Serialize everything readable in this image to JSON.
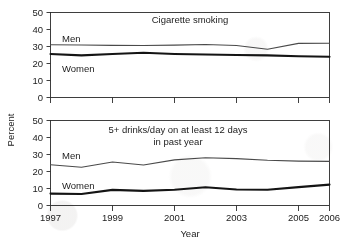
{
  "figure": {
    "xlabel": "Year",
    "ylabel": "Percent"
  },
  "panels": {
    "top": {
      "title": "Cigarette smoking",
      "men_label": "Men",
      "women_label": "Women",
      "yticks": [
        "0",
        "10",
        "20",
        "30",
        "40",
        "50"
      ]
    },
    "bottom": {
      "title_line1": "5+ drinks/day on at least 12 days",
      "title_line2": "in past year",
      "men_label": "Men",
      "women_label": "Women",
      "yticks": [
        "0",
        "10",
        "20",
        "30",
        "40",
        "50"
      ]
    }
  },
  "xticks": [
    "1997",
    "1999",
    "2001",
    "2003",
    "2005",
    "2006"
  ],
  "chart_data": [
    {
      "type": "line",
      "title": "Cigarette smoking",
      "xlabel": "Year",
      "ylabel": "Percent",
      "x": [
        1997,
        1998,
        1999,
        2000,
        2001,
        2002,
        2003,
        2004,
        2005,
        2006
      ],
      "xlim": [
        1997,
        2006
      ],
      "ylim": [
        0,
        50
      ],
      "yticks": [
        0,
        10,
        20,
        30,
        40,
        50
      ],
      "xticks": [
        1997,
        1999,
        2001,
        2003,
        2005,
        2006
      ],
      "grid": false,
      "legend": "inline-labels",
      "series": [
        {
          "name": "Men",
          "values": [
            31.0,
            30.9,
            30.7,
            30.6,
            30.8,
            31.2,
            30.6,
            28.4,
            31.8,
            31.9
          ],
          "style": "thin-gray"
        },
        {
          "name": "Women",
          "values": [
            25.6,
            24.8,
            25.6,
            26.3,
            25.6,
            25.3,
            25.0,
            24.8,
            24.3,
            24.0
          ],
          "style": "thick-black"
        }
      ]
    },
    {
      "type": "line",
      "title": "5+ drinks/day on at least 12 days in past year",
      "xlabel": "Year",
      "ylabel": "Percent",
      "x": [
        1997,
        1998,
        1999,
        2000,
        2001,
        2002,
        2003,
        2004,
        2005,
        2006
      ],
      "xlim": [
        1997,
        2006
      ],
      "ylim": [
        0,
        50
      ],
      "yticks": [
        0,
        10,
        20,
        30,
        40,
        50
      ],
      "xticks": [
        1997,
        1999,
        2001,
        2003,
        2005,
        2006
      ],
      "grid": false,
      "legend": "inline-labels",
      "series": [
        {
          "name": "Men",
          "values": [
            24.0,
            22.5,
            25.6,
            23.8,
            26.8,
            28.1,
            27.6,
            26.6,
            26.1,
            26.0
          ],
          "style": "thin-gray"
        },
        {
          "name": "Women",
          "values": [
            7.0,
            6.8,
            9.2,
            8.6,
            9.3,
            10.7,
            9.4,
            9.3,
            10.8,
            12.3
          ],
          "style": "thick-black"
        }
      ]
    }
  ]
}
